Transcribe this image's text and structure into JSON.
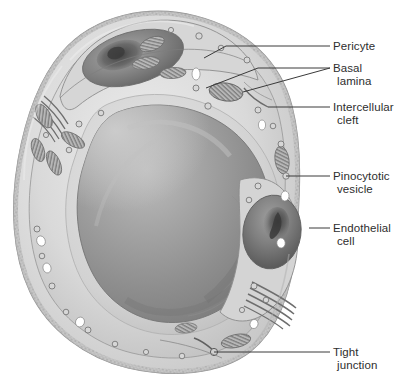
{
  "figure": {
    "style": "grayscale histological illustration",
    "background_color": "#ffffff",
    "leader_line_color": "#3a3a3a",
    "label_text_color": "#2e2e2e",
    "palette": {
      "lumen_light": "#d8d8d8",
      "lumen_mid": "#9a9a9a",
      "lumen_dark": "#7c7c7c",
      "cytoplasm": "#c9c9c9",
      "cytoplasm_light": "#e2e2e2",
      "basal_lamina": "#b4b4b4",
      "nucleus_dark": "#5e5e5e",
      "nucleus_darkest": "#474747",
      "mitochondria": "#8d8d8d",
      "vesicle_white": "#ffffff",
      "outline": "#6f6f6f"
    }
  },
  "labels": [
    {
      "id": "pericyte",
      "line1": "Pericyte",
      "line2": "",
      "x": 333,
      "y": 40
    },
    {
      "id": "basal-lamina",
      "line1": "Basal",
      "line2": "lamina",
      "x": 333,
      "y": 62
    },
    {
      "id": "intercellular-cleft",
      "line1": "Intercellular",
      "line2": "cleft",
      "x": 333,
      "y": 101
    },
    {
      "id": "pinocytotic-vesicle",
      "line1": "Pinocytotic",
      "line2": "vesicle",
      "x": 333,
      "y": 170
    },
    {
      "id": "endothelial-cell",
      "line1": "Endothelial",
      "line2": "cell",
      "x": 333,
      "y": 222
    },
    {
      "id": "tight-junction",
      "line1": "Tight",
      "line2": "junction",
      "x": 333,
      "y": 346
    }
  ],
  "leaders": [
    {
      "id": "leader-pericyte",
      "points": "204,58 226,46 330,46"
    },
    {
      "id": "leader-basal-lamina-upper",
      "points": "330,68 258,68 206,88"
    },
    {
      "id": "leader-basal-lamina-lower",
      "points": "330,68 243,92"
    },
    {
      "id": "leader-intercellular-cleft",
      "points": "330,107 268,107"
    },
    {
      "id": "leader-pinocytotic-vesicle",
      "points": "330,176 286,176"
    },
    {
      "id": "leader-endothelial-cell",
      "points": "330,228 309,228"
    },
    {
      "id": "leader-tight-junction",
      "points": "330,352 214,352"
    }
  ],
  "caption": {
    "text": "",
    "visible": false
  }
}
